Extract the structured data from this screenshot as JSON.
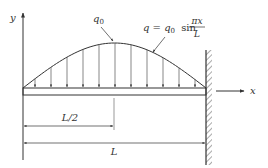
{
  "diagram": {
    "axes": {
      "y_label": "y",
      "x_label": "x"
    },
    "load": {
      "peak_label": "q",
      "peak_sub": "0",
      "formula": {
        "lhs": "q",
        "eq": "=",
        "coef": "q",
        "coef_sub": "0",
        "func": "sin",
        "numerator": "πx",
        "denominator": "L"
      },
      "arrow_count": 11
    },
    "dimensions": [
      {
        "label": "L/2",
        "fraction_of_span": 0.5
      },
      {
        "label": "L",
        "fraction_of_span": 1.0
      }
    ],
    "colors": {
      "line": "#333333",
      "thin": "#555555"
    }
  }
}
